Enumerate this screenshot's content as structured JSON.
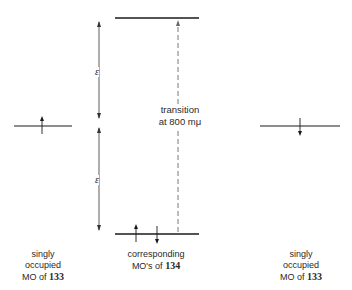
{
  "diagram": {
    "epsilon_symbol": "ε",
    "transition": {
      "line1": "transition",
      "line2": "at 800 mμ"
    },
    "left_label": {
      "line1": "singly",
      "line2": "occupied",
      "line3_prefix": "MO of",
      "compound": "133"
    },
    "center_label": {
      "line1": "corresponding",
      "line2_prefix": "MO's of",
      "compound": "134"
    },
    "right_label": {
      "line1": "singly",
      "line2": "occupied",
      "line3_prefix": "MO of",
      "compound": "133"
    },
    "levels": [
      {
        "name": "upper-mo-134",
        "electrons": []
      },
      {
        "name": "lower-mo-134",
        "electrons": [
          "up",
          "down"
        ]
      },
      {
        "name": "left-somo-133",
        "electrons": [
          "up"
        ]
      },
      {
        "name": "right-somo-133",
        "electrons": [
          "down"
        ]
      }
    ],
    "colors": {
      "line": "#1a1a1a",
      "text": "#2a2a2a",
      "dashed": "#555555"
    }
  }
}
